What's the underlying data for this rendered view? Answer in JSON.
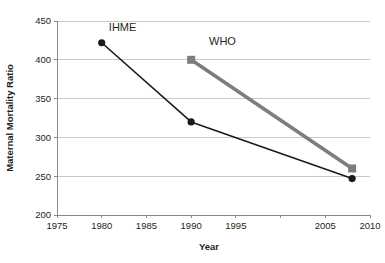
{
  "chart_data": {
    "type": "line",
    "title": "",
    "xlabel": "Year",
    "ylabel": "Maternal Mortality Ratio",
    "xlim": [
      1975,
      2010
    ],
    "ylim": [
      200,
      450
    ],
    "grid": true,
    "grid_axis": "y",
    "legend": "inline-labels",
    "x_ticks": [
      1975,
      1980,
      1985,
      1990,
      1995,
      2000,
      2005,
      2010
    ],
    "x_tick_labels": [
      "1975",
      "1980",
      "1985",
      "1990",
      "1995",
      "",
      "2005",
      "2010"
    ],
    "y_ticks": [
      200,
      250,
      300,
      350,
      400,
      450
    ],
    "y_tick_labels": [
      "200",
      "250",
      "300",
      "350",
      "400",
      "450"
    ],
    "series": [
      {
        "name": "IHME",
        "label": "IHME",
        "color": "#1a1a1a",
        "marker": "circle",
        "line_width": 1.6,
        "x": [
          1980,
          1990,
          2008
        ],
        "values": [
          422,
          320,
          247
        ]
      },
      {
        "name": "WHO",
        "label": "WHO",
        "color": "#7d7d7d",
        "marker": "square",
        "line_width": 3.6,
        "x": [
          1990,
          2008
        ],
        "values": [
          400,
          260
        ]
      }
    ],
    "annotations": [
      {
        "text": "IHME",
        "x": 1980.8,
        "y": 437
      },
      {
        "text": "WHO",
        "x": 1992.0,
        "y": 419
      }
    ]
  },
  "axes": {
    "y_title": "Maternal Mortality Ratio",
    "x_title": "Year"
  },
  "colors": {
    "ihme": "#1a1a1a",
    "who": "#7d7d7d",
    "grid": "#c9c9c9",
    "axis": "#8a8a8a",
    "text": "#231f20",
    "background": "#ffffff"
  }
}
